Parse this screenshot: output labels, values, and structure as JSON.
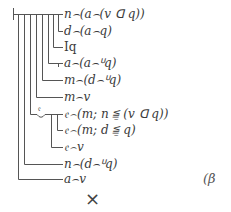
{
  "diagram": {
    "type": "Begriffsschrift formula",
    "formulas": [
      {
        "id": 1,
        "text": "n⌢(a⌢(v ꓷ q))"
      },
      {
        "id": 2,
        "text": "d⌢(a⌢q)"
      },
      {
        "id": 3,
        "text": "Iq"
      },
      {
        "id": 4,
        "text": "a⌢(a⌢ᓑq)"
      },
      {
        "id": 5,
        "text": "m⌢(d⌢ᓑq)"
      },
      {
        "id": 6,
        "text": "m⌢v"
      },
      {
        "id": 7,
        "text": "𝔢⌢(m; n ≦̱ (v ꓷ q))"
      },
      {
        "id": 8,
        "text": "𝔢⌢(m; d ≦̱ q)"
      },
      {
        "id": 9,
        "text": "𝔢⌢v"
      },
      {
        "id": 10,
        "text": "n⌢(d⌢ᓑq)"
      },
      {
        "id": 11,
        "text": "a⌢v"
      }
    ],
    "concavity_letter": "𝔢",
    "equation_number": "(β",
    "close_symbol": "×"
  },
  "colors": {
    "line": "#555555",
    "text": "#3a3a3a",
    "background": "#ffffff"
  }
}
